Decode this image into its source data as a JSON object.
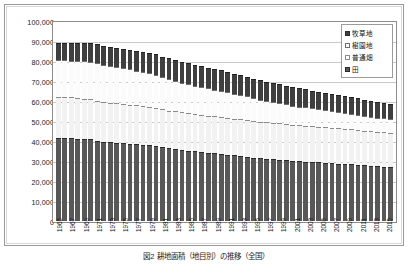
{
  "chart_data": {
    "type": "bar",
    "stacked": true,
    "title": "",
    "xlabel": "",
    "ylabel": "",
    "ylim": [
      0,
      100000
    ],
    "ytick_labels": [
      "100,000",
      "90,000",
      "80,000",
      "70,000",
      "60,000",
      "50,000",
      "40,000",
      "30,000",
      "20,000",
      "10,000",
      "0"
    ],
    "yticks": [
      100000,
      90000,
      80000,
      70000,
      60000,
      50000,
      40000,
      30000,
      20000,
      10000,
      0
    ],
    "grid": true,
    "legend_position": "top-right",
    "legend": [
      "牧草地",
      "樹園地",
      "普通畑",
      "田"
    ],
    "categories": [
      "1965",
      "1966",
      "1967",
      "1968",
      "1969",
      "1970",
      "1971",
      "1972",
      "1973",
      "1974",
      "1975",
      "1976",
      "1977",
      "1978",
      "1979",
      "1980",
      "1981",
      "1982",
      "1983",
      "1984",
      "1985",
      "1986",
      "1987",
      "1988",
      "1989",
      "1990",
      "1991",
      "1992",
      "1993",
      "1994",
      "1995",
      "1996",
      "1997",
      "1998",
      "1999",
      "2000",
      "2001",
      "2002",
      "2003",
      "2004",
      "2005",
      "2006",
      "2007",
      "2008",
      "2009",
      "2010",
      "2011",
      "2012",
      "2013",
      "2014",
      "2015",
      "2016"
    ],
    "tick_labels": [
      "1965",
      "",
      "1967",
      "",
      "1969",
      "",
      "1971",
      "",
      "1973",
      "",
      "1975",
      "",
      "1977",
      "",
      "1979",
      "",
      "1981",
      "",
      "1983",
      "",
      "1985",
      "",
      "1987",
      "",
      "1989",
      "",
      "1991",
      "",
      "1993",
      "",
      "1995",
      "",
      "1997",
      "",
      "1999",
      "",
      "2001",
      "",
      "2003",
      "",
      "2005",
      "",
      "2007",
      "",
      "2009",
      "",
      "2011",
      "",
      "2013",
      "",
      "2015",
      ""
    ],
    "series": [
      {
        "name": "田",
        "key": "paddy",
        "values": [
          41500,
          41500,
          41400,
          41200,
          41000,
          40800,
          40200,
          39700,
          39300,
          39100,
          38800,
          38600,
          38400,
          38100,
          37800,
          37500,
          36800,
          36300,
          35900,
          35500,
          35100,
          34800,
          34400,
          34100,
          33800,
          33500,
          33100,
          32800,
          32500,
          32200,
          31700,
          31400,
          31100,
          30900,
          30700,
          30400,
          30100,
          29900,
          29700,
          29500,
          29300,
          29100,
          28900,
          28700,
          28500,
          28300,
          28000,
          27800,
          27600,
          27400,
          27200,
          27000
        ]
      },
      {
        "name": "普通畑",
        "key": "field",
        "values": [
          20600,
          20500,
          20400,
          20300,
          20200,
          20100,
          20000,
          19900,
          19800,
          19700,
          19600,
          19500,
          19400,
          19300,
          19200,
          19100,
          19000,
          18950,
          18900,
          18850,
          18800,
          18750,
          18700,
          18650,
          18600,
          18550,
          18500,
          18450,
          18400,
          18350,
          18300,
          18250,
          18200,
          18150,
          18100,
          18050,
          18000,
          17950,
          17900,
          17850,
          17800,
          17750,
          17700,
          17650,
          17600,
          17550,
          17500,
          17450,
          17400,
          17350,
          17300,
          17250
        ]
      },
      {
        "name": "樹園地",
        "key": "orchard",
        "values": [
          18200,
          18300,
          18400,
          18500,
          18600,
          18700,
          18800,
          18600,
          18400,
          18200,
          18000,
          17700,
          17400,
          17100,
          16800,
          16500,
          16100,
          15700,
          15300,
          14900,
          14500,
          14200,
          13900,
          13600,
          13300,
          13000,
          12700,
          12400,
          12100,
          11800,
          11400,
          11100,
          10800,
          10500,
          10200,
          9900,
          9600,
          9400,
          9200,
          9000,
          8800,
          8600,
          8400,
          8200,
          8000,
          7800,
          7600,
          7400,
          7200,
          7000,
          6800,
          6600
        ]
      },
      {
        "name": "牧草地",
        "key": "pasture",
        "values": [
          8700,
          8800,
          8900,
          9000,
          9100,
          9200,
          9300,
          9400,
          9500,
          9600,
          9700,
          9800,
          9900,
          10000,
          10100,
          10200,
          10300,
          10400,
          10450,
          10500,
          10500,
          10450,
          10400,
          10350,
          10300,
          10250,
          10200,
          10100,
          10000,
          9900,
          9800,
          9700,
          9600,
          9500,
          9400,
          9300,
          9200,
          9100,
          9000,
          8900,
          8800,
          8700,
          8600,
          8500,
          8400,
          8300,
          8200,
          8100,
          8000,
          7900,
          7800,
          7700
        ]
      }
    ],
    "totals": [
      89000,
      89100,
      89100,
      89000,
      88900,
      88800,
      88300,
      87600,
      87000,
      86600,
      86100,
      85600,
      85100,
      84500,
      83900,
      83300,
      82200,
      81350,
      80550,
      79750,
      78900,
      78200,
      77400,
      76700,
      76000,
      75300,
      74500,
      73750,
      73000,
      72250,
      71200,
      70450,
      69700,
      69050,
      68400,
      67650,
      66900,
      66350,
      65800,
      65250,
      64700,
      64150,
      63600,
      63050,
      62500,
      61950,
      61300,
      60750,
      60200,
      59650,
      59100,
      58550
    ],
    "colors": {
      "paddy": "#585858",
      "field": "#f2f2f2",
      "orchard": "#fbfbfb",
      "pasture": "#3f3f3f",
      "gridline": "#c9c9c9",
      "axis": "#8c8c8c"
    }
  },
  "caption": {
    "text": "図2 耕地面積（地目別）の推移（全国）"
  }
}
